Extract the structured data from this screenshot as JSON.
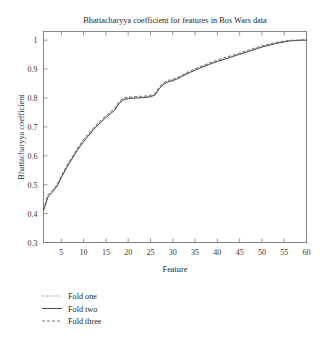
{
  "chart_data": {
    "type": "line",
    "title": "Bhattacharyya coefficient for features in Bos Wars data",
    "xlabel": "Feature",
    "ylabel": "Bhattacharyya coefficient",
    "xlim": [
      1,
      60
    ],
    "ylim": [
      0.3,
      1.03
    ],
    "xticks": [
      5,
      10,
      15,
      20,
      25,
      30,
      35,
      40,
      45,
      50,
      55,
      60
    ],
    "yticks": [
      0.3,
      0.4,
      0.5,
      0.6,
      0.7,
      0.8,
      0.9,
      1
    ],
    "ytick_labels": [
      "0.3",
      "0.4",
      "0.5",
      "0.6",
      "0.7",
      "0.8",
      "0.9",
      "1"
    ],
    "xtick_labels": [
      "5",
      "10",
      "15",
      "20",
      "25",
      "30",
      "35",
      "40",
      "45",
      "50",
      "55",
      "60"
    ],
    "grid": false,
    "legend_position": "below-left",
    "x": [
      1,
      2,
      3,
      4,
      5,
      6,
      7,
      8,
      9,
      10,
      11,
      12,
      13,
      14,
      15,
      16,
      17,
      18,
      19,
      20,
      21,
      22,
      23,
      24,
      25,
      26,
      27,
      28,
      29,
      30,
      31,
      32,
      33,
      34,
      35,
      36,
      37,
      38,
      39,
      40,
      41,
      42,
      43,
      44,
      45,
      46,
      47,
      48,
      49,
      50,
      51,
      52,
      53,
      54,
      55,
      56,
      57,
      58,
      59,
      60
    ],
    "series": [
      {
        "name": "Fold one",
        "style": "dotted",
        "color": "#555049",
        "values": [
          0.412,
          0.462,
          0.478,
          0.497,
          0.528,
          0.557,
          0.583,
          0.608,
          0.632,
          0.653,
          0.672,
          0.69,
          0.707,
          0.722,
          0.736,
          0.749,
          0.762,
          0.786,
          0.797,
          0.8,
          0.801,
          0.802,
          0.803,
          0.804,
          0.806,
          0.812,
          0.836,
          0.851,
          0.858,
          0.862,
          0.868,
          0.876,
          0.884,
          0.891,
          0.898,
          0.905,
          0.911,
          0.917,
          0.923,
          0.928,
          0.933,
          0.938,
          0.943,
          0.948,
          0.953,
          0.958,
          0.963,
          0.968,
          0.973,
          0.978,
          0.982,
          0.986,
          0.99,
          0.993,
          0.996,
          0.998,
          0.999,
          1.0,
          1.0,
          1.0
        ]
      },
      {
        "name": "Fold two",
        "style": "solid",
        "color": "#3a352f",
        "values": [
          0.41,
          0.458,
          0.474,
          0.494,
          0.524,
          0.553,
          0.579,
          0.604,
          0.628,
          0.649,
          0.668,
          0.686,
          0.703,
          0.718,
          0.732,
          0.745,
          0.758,
          0.782,
          0.794,
          0.798,
          0.799,
          0.8,
          0.801,
          0.802,
          0.804,
          0.81,
          0.833,
          0.848,
          0.856,
          0.86,
          0.866,
          0.874,
          0.882,
          0.889,
          0.896,
          0.903,
          0.909,
          0.915,
          0.921,
          0.926,
          0.931,
          0.936,
          0.941,
          0.946,
          0.951,
          0.956,
          0.961,
          0.966,
          0.971,
          0.976,
          0.98,
          0.984,
          0.988,
          0.991,
          0.994,
          0.997,
          0.998,
          0.999,
          1.0,
          1.0
        ]
      },
      {
        "name": "Fold three",
        "style": "dashed",
        "color": "#6b6660",
        "values": [
          0.414,
          0.465,
          0.481,
          0.5,
          0.531,
          0.56,
          0.586,
          0.611,
          0.635,
          0.656,
          0.675,
          0.693,
          0.71,
          0.725,
          0.739,
          0.752,
          0.765,
          0.789,
          0.8,
          0.803,
          0.804,
          0.805,
          0.806,
          0.807,
          0.809,
          0.815,
          0.839,
          0.854,
          0.861,
          0.865,
          0.871,
          0.879,
          0.887,
          0.894,
          0.901,
          0.908,
          0.914,
          0.92,
          0.926,
          0.931,
          0.936,
          0.941,
          0.946,
          0.951,
          0.956,
          0.961,
          0.966,
          0.971,
          0.976,
          0.981,
          0.985,
          0.988,
          0.992,
          0.995,
          0.997,
          0.999,
          1.0,
          1.0,
          1.001,
          1.001
        ]
      }
    ]
  },
  "legend": {
    "items": [
      {
        "label": "Fold one"
      },
      {
        "label": "Fold two"
      },
      {
        "label": "Fold three"
      }
    ]
  }
}
